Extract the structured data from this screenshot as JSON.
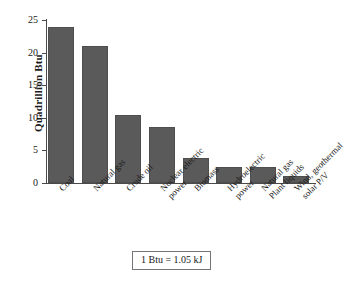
{
  "chart_data": {
    "type": "bar",
    "title": "",
    "xlabel": "",
    "ylabel": "Quadrillion Btu",
    "ylim": [
      0,
      25
    ],
    "yticks": [
      0,
      5,
      10,
      15,
      20,
      25
    ],
    "ytick_labels": [
      "0",
      "5",
      "10",
      "15",
      "20",
      "25"
    ],
    "grid": false,
    "legend": "none",
    "bar_color": "#5a5a5a",
    "categories": [
      "Coal",
      "Natural gas",
      "Crude oil",
      "Nuclear electric power",
      "Biomass",
      "Hydroelectric power",
      "Natural gas Plant liquids",
      "Wind, geothermal solar P/V"
    ],
    "category_lines": [
      [
        "Coal",
        ""
      ],
      [
        "Natural gas",
        ""
      ],
      [
        "Crude oil",
        ""
      ],
      [
        "Nuclear electric",
        "power"
      ],
      [
        "Biomass",
        ""
      ],
      [
        "Hydroelectric",
        "power"
      ],
      [
        "Natural gas",
        "Plant liquids"
      ],
      [
        "Wind, geothermal",
        "solar P/V"
      ]
    ],
    "values": [
      24.0,
      21.0,
      10.4,
      8.6,
      3.9,
      2.5,
      2.4,
      1.1
    ]
  },
  "footnote": {
    "text": "1 Btu = 1.05 kJ"
  }
}
